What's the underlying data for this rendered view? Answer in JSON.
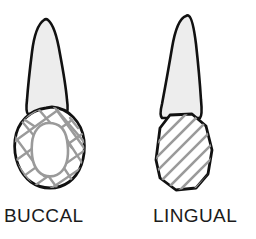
{
  "figure": {
    "background_color": "#ffffff",
    "outline_color": "#111111",
    "root_fill_color": "#ededed",
    "crown_fill_color": "#ffffff",
    "hatch_color": "#9a9a9a",
    "label_color": "#1b1b1b"
  },
  "views": [
    {
      "id": "buccal",
      "label": "BUCCAL",
      "crown_pattern": "irregular-crosshatch",
      "crown_shape": "oval",
      "has_inner_oval": true,
      "root_shape": "tapered-pointed"
    },
    {
      "id": "lingual",
      "label": "LINGUAL",
      "crown_pattern": "parallel-diagonal-hatch",
      "crown_shape": "shield-pentagon",
      "has_inner_oval": false,
      "root_shape": "tapered-pointed"
    }
  ]
}
